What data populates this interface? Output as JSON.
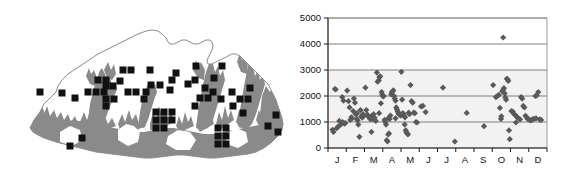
{
  "figure": {
    "panels": [
      "distribution-map",
      "elevation-month-scatter"
    ],
    "background_color": "#ffffff"
  },
  "map": {
    "name": "Bhutan distribution map",
    "country_outline_color": "#8c8c8c",
    "forest_shading_color": "#8a8a8a",
    "record_square_color": "#111111",
    "record_square_size_px": 7,
    "record_count": 62,
    "records": [
      [
        62,
        93
      ],
      [
        75,
        98
      ],
      [
        88,
        92
      ],
      [
        96,
        92
      ],
      [
        104,
        92
      ],
      [
        98,
        80
      ],
      [
        106,
        80
      ],
      [
        106,
        86
      ],
      [
        106,
        99
      ],
      [
        106,
        106
      ],
      [
        113,
        86
      ],
      [
        114,
        99
      ],
      [
        120,
        81
      ],
      [
        128,
        92
      ],
      [
        136,
        92
      ],
      [
        146,
        92
      ],
      [
        151,
        85
      ],
      [
        160,
        85
      ],
      [
        144,
        99
      ],
      [
        172,
        80
      ],
      [
        170,
        90
      ],
      [
        176,
        73
      ],
      [
        156,
        112
      ],
      [
        164,
        112
      ],
      [
        172,
        112
      ],
      [
        156,
        120
      ],
      [
        164,
        120
      ],
      [
        172,
        120
      ],
      [
        156,
        128
      ],
      [
        164,
        128
      ],
      [
        196,
        66
      ],
      [
        195,
        80
      ],
      [
        200,
        98
      ],
      [
        208,
        98
      ],
      [
        195,
        106
      ],
      [
        214,
        78
      ],
      [
        222,
        66
      ],
      [
        213,
        92
      ],
      [
        221,
        99
      ],
      [
        232,
        92
      ],
      [
        240,
        99
      ],
      [
        233,
        106
      ],
      [
        218,
        128
      ],
      [
        226,
        128
      ],
      [
        218,
        136
      ],
      [
        226,
        136
      ],
      [
        218,
        144
      ],
      [
        226,
        144
      ],
      [
        248,
        99
      ],
      [
        243,
        113
      ],
      [
        268,
        126
      ],
      [
        276,
        115
      ],
      [
        278,
        132
      ],
      [
        82,
        138
      ],
      [
        70,
        146
      ],
      [
        40,
        92
      ],
      [
        188,
        84
      ],
      [
        150,
        70
      ],
      [
        123,
        70
      ],
      [
        131,
        70
      ],
      [
        205,
        88
      ],
      [
        250,
        88
      ]
    ]
  },
  "chart_data": {
    "type": "scatter",
    "title": "",
    "xlabel": "",
    "ylabel": "",
    "xlim": [
      0,
      12
    ],
    "ylim": [
      0,
      5000
    ],
    "yticks": [
      0,
      1000,
      2000,
      3000,
      4000,
      5000
    ],
    "ytick_labels": [
      "0",
      "1000",
      "2000",
      "3000",
      "4000",
      "5000"
    ],
    "xtick_labels": [
      "J",
      "F",
      "M",
      "A",
      "M",
      "J",
      "J",
      "A",
      "S",
      "O",
      "N",
      "D"
    ],
    "xtick_positions": [
      0.5,
      1.5,
      2.5,
      3.5,
      4.5,
      5.5,
      6.5,
      7.5,
      8.5,
      9.5,
      10.5,
      11.5
    ],
    "grid": true,
    "gridline_color": "#808080",
    "plot_background_color": "#f2f2f2",
    "marker": "diamond",
    "marker_color": "#595959",
    "marker_size_px": 5,
    "frame_color": "#9a9a9a",
    "point_count": 147,
    "points": [
      [
        0.25,
        700
      ],
      [
        0.3,
        620
      ],
      [
        0.38,
        2270
      ],
      [
        0.42,
        2250
      ],
      [
        0.48,
        760
      ],
      [
        0.55,
        820
      ],
      [
        0.62,
        1040
      ],
      [
        0.7,
        900
      ],
      [
        0.78,
        1960
      ],
      [
        0.85,
        1820
      ],
      [
        0.9,
        940
      ],
      [
        0.95,
        960
      ],
      [
        1.05,
        2210
      ],
      [
        1.12,
        1800
      ],
      [
        1.18,
        1560
      ],
      [
        1.22,
        1080
      ],
      [
        1.28,
        1180
      ],
      [
        1.32,
        1140
      ],
      [
        1.38,
        1420
      ],
      [
        1.42,
        1900
      ],
      [
        1.48,
        1740
      ],
      [
        1.52,
        1300
      ],
      [
        1.58,
        1120
      ],
      [
        1.62,
        1060
      ],
      [
        1.66,
        900
      ],
      [
        1.72,
        430
      ],
      [
        1.78,
        1460
      ],
      [
        1.82,
        1220
      ],
      [
        1.88,
        1170
      ],
      [
        1.92,
        1300
      ],
      [
        1.96,
        1230
      ],
      [
        2.05,
        2320
      ],
      [
        2.1,
        1460
      ],
      [
        2.16,
        1280
      ],
      [
        2.22,
        1200
      ],
      [
        2.28,
        1170
      ],
      [
        2.32,
        1110
      ],
      [
        2.38,
        620
      ],
      [
        2.44,
        1120
      ],
      [
        2.5,
        1300
      ],
      [
        2.56,
        1160
      ],
      [
        2.62,
        1040
      ],
      [
        2.68,
        2900
      ],
      [
        2.72,
        2550
      ],
      [
        2.78,
        2600
      ],
      [
        2.82,
        2720
      ],
      [
        2.86,
        2760
      ],
      [
        2.9,
        1720
      ],
      [
        2.94,
        2150
      ],
      [
        2.97,
        2050
      ],
      [
        3.02,
        1980
      ],
      [
        3.06,
        2000
      ],
      [
        3.1,
        1080
      ],
      [
        3.14,
        1000
      ],
      [
        3.18,
        900
      ],
      [
        3.22,
        300
      ],
      [
        3.26,
        250
      ],
      [
        3.3,
        520
      ],
      [
        3.34,
        560
      ],
      [
        3.38,
        1120
      ],
      [
        3.42,
        1250
      ],
      [
        3.46,
        2060
      ],
      [
        3.5,
        2140
      ],
      [
        3.54,
        2180
      ],
      [
        3.58,
        2220
      ],
      [
        3.62,
        2000
      ],
      [
        3.66,
        1900
      ],
      [
        3.7,
        1820
      ],
      [
        3.74,
        1560
      ],
      [
        3.78,
        1480
      ],
      [
        3.82,
        1400
      ],
      [
        3.86,
        1320
      ],
      [
        3.9,
        1300
      ],
      [
        3.94,
        1280
      ],
      [
        3.98,
        1240
      ],
      [
        4.02,
        2930
      ],
      [
        4.06,
        1860
      ],
      [
        4.1,
        1340
      ],
      [
        4.14,
        1300
      ],
      [
        4.18,
        1220
      ],
      [
        4.22,
        1180
      ],
      [
        4.26,
        680
      ],
      [
        4.3,
        600
      ],
      [
        4.34,
        560
      ],
      [
        4.38,
        520
      ],
      [
        4.42,
        1360
      ],
      [
        4.46,
        1300
      ],
      [
        4.52,
        2420
      ],
      [
        4.58,
        1800
      ],
      [
        4.64,
        1740
      ],
      [
        4.7,
        1360
      ],
      [
        4.76,
        1340
      ],
      [
        4.82,
        1000
      ],
      [
        4.88,
        980
      ],
      [
        5.1,
        1600
      ],
      [
        5.2,
        1620
      ],
      [
        5.35,
        1380
      ],
      [
        6.3,
        2320
      ],
      [
        6.95,
        250
      ],
      [
        7.6,
        1350
      ],
      [
        8.55,
        840
      ],
      [
        9.05,
        2420
      ],
      [
        9.2,
        1960
      ],
      [
        9.28,
        2000
      ],
      [
        9.36,
        2040
      ],
      [
        9.42,
        1540
      ],
      [
        9.48,
        1120
      ],
      [
        9.55,
        2180
      ],
      [
        9.6,
        2240
      ],
      [
        9.64,
        2300
      ],
      [
        9.68,
        2100
      ],
      [
        9.72,
        1940
      ],
      [
        9.76,
        1860
      ],
      [
        9.8,
        2660
      ],
      [
        9.84,
        2640
      ],
      [
        9.88,
        2580
      ],
      [
        9.92,
        680
      ],
      [
        9.96,
        340
      ],
      [
        10.05,
        1420
      ],
      [
        10.12,
        1400
      ],
      [
        10.2,
        1300
      ],
      [
        10.28,
        1260
      ],
      [
        10.36,
        1180
      ],
      [
        10.44,
        1140
      ],
      [
        10.52,
        1100
      ],
      [
        10.58,
        1960
      ],
      [
        10.64,
        1900
      ],
      [
        10.7,
        1620
      ],
      [
        10.76,
        1560
      ],
      [
        10.82,
        1240
      ],
      [
        10.88,
        1180
      ],
      [
        10.94,
        1120
      ],
      [
        11.05,
        1080
      ],
      [
        11.12,
        1060
      ],
      [
        11.2,
        1100
      ],
      [
        11.28,
        1120
      ],
      [
        11.36,
        2000
      ],
      [
        11.44,
        2020
      ],
      [
        11.52,
        2150
      ],
      [
        11.6,
        1100
      ],
      [
        11.68,
        1080
      ],
      [
        9.6,
        4250
      ],
      [
        2.4,
        1240
      ],
      [
        3.3,
        1140
      ],
      [
        4.2,
        900
      ],
      [
        1.6,
        1340
      ],
      [
        0.8,
        1000
      ],
      [
        10.3,
        980
      ],
      [
        11.4,
        1140
      ],
      [
        9.5,
        1220
      ],
      [
        3.7,
        1140
      ],
      [
        2.8,
        1340
      ]
    ]
  }
}
